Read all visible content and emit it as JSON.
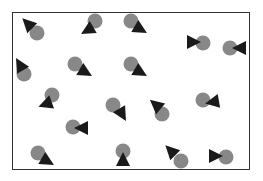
{
  "colors": {
    "circle": "#888888",
    "triangle": "#1a1a1a",
    "frame": "#333333",
    "background": "#ffffff"
  },
  "frame": {
    "x": 12,
    "y": 12,
    "width": 238,
    "height": 158
  },
  "pairs": [
    {
      "cx": 37,
      "cy": 33,
      "tx": 28,
      "ty": 24,
      "angle": 225
    },
    {
      "cx": 95,
      "cy": 21,
      "tx": 88,
      "ty": 30,
      "angle": 150
    },
    {
      "cx": 131,
      "cy": 21,
      "tx": 140,
      "ty": 29,
      "angle": 30
    },
    {
      "cx": 203,
      "cy": 43,
      "tx": 193,
      "ty": 42,
      "angle": 0
    },
    {
      "cx": 230,
      "cy": 48,
      "tx": 240,
      "ty": 48,
      "angle": 180
    },
    {
      "cx": 24,
      "cy": 74,
      "tx": 20,
      "ty": 65,
      "angle": 240
    },
    {
      "cx": 75,
      "cy": 64,
      "tx": 85,
      "ty": 72,
      "angle": 30
    },
    {
      "cx": 131,
      "cy": 64,
      "tx": 140,
      "ty": 72,
      "angle": 30
    },
    {
      "cx": 52,
      "cy": 95,
      "tx": 46,
      "ty": 104,
      "angle": 160
    },
    {
      "cx": 113,
      "cy": 105,
      "tx": 122,
      "ty": 114,
      "angle": 60
    },
    {
      "cx": 162,
      "cy": 114,
      "tx": 156,
      "ty": 105,
      "angle": 220
    },
    {
      "cx": 203,
      "cy": 100,
      "tx": 213,
      "ty": 102,
      "angle": 170
    },
    {
      "cx": 73,
      "cy": 127,
      "tx": 82,
      "ty": 128,
      "angle": 180
    },
    {
      "cx": 38,
      "cy": 153,
      "tx": 47,
      "ty": 161,
      "angle": 30
    },
    {
      "cx": 123,
      "cy": 151,
      "tx": 123,
      "ty": 160,
      "angle": 270
    },
    {
      "cx": 181,
      "cy": 161,
      "tx": 171,
      "ty": 151,
      "angle": 225
    },
    {
      "cx": 226,
      "cy": 157,
      "tx": 215,
      "ty": 156,
      "angle": 0
    }
  ]
}
